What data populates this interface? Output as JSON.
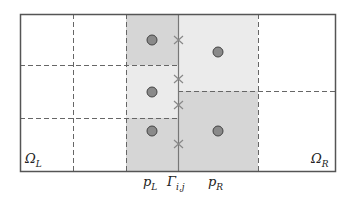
{
  "diagram": {
    "type": "finite-volume-interface-mesh",
    "colors": {
      "border": "#555555",
      "dashed": "#666666",
      "shade_dark": "#d6d6d6",
      "shade_light": "#ebebeb",
      "point_fill": "#8a8a8a",
      "point_stroke": "#444444",
      "cross": "#888888",
      "interface": "#777777"
    },
    "labels": {
      "omega_left": "Ω",
      "omega_left_sub": "L",
      "omega_right": "Ω",
      "omega_right_sub": "R",
      "p_left": "p",
      "p_left_sub": "L",
      "gamma": "Γ",
      "gamma_sub": "i,j",
      "p_right": "p",
      "p_right_sub": "R"
    },
    "left_cells": [
      {
        "shade": "dark",
        "point": [
          152,
          40
        ]
      },
      {
        "shade": "light",
        "point": [
          152,
          92
        ]
      },
      {
        "shade": "dark",
        "point": [
          152,
          131
        ]
      }
    ],
    "right_cells": [
      {
        "shade": "light",
        "point": [
          218,
          52
        ]
      },
      {
        "shade": "dark",
        "point": [
          218,
          131
        ]
      }
    ],
    "interface_crosses_y": [
      40,
      79,
      105,
      144
    ]
  }
}
